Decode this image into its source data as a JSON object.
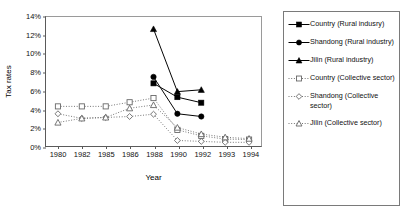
{
  "chart_data": {
    "type": "line",
    "title": "",
    "xlabel": "Year",
    "ylabel": "Tax rates",
    "categories": [
      "1980",
      "1982",
      "1985",
      "1986",
      "1988",
      "1990",
      "1992",
      "1993",
      "1994"
    ],
    "ylim": [
      0,
      14
    ],
    "ytick_values": [
      0,
      2,
      4,
      6,
      8,
      10,
      12,
      14
    ],
    "ytick_labels": [
      "0%",
      "2%",
      "4%",
      "6%",
      "8%",
      "10%",
      "12%",
      "14%"
    ],
    "grid": false,
    "legend_position": "right-outside",
    "series": [
      {
        "name": "Country (Rural indusry)",
        "marker": "filled-square",
        "line": "solid",
        "color": "#000000",
        "x": [
          "1988",
          "1990",
          "1992"
        ],
        "values": [
          6.8,
          5.3,
          4.7
        ]
      },
      {
        "name": "Shandong (Rural industry)",
        "marker": "filled-circle",
        "line": "solid",
        "color": "#000000",
        "x": [
          "1988",
          "1990",
          "1992"
        ],
        "values": [
          7.5,
          3.5,
          3.2
        ]
      },
      {
        "name": "Jilin (Rural industry)",
        "marker": "filled-triangle",
        "line": "solid",
        "color": "#000000",
        "x": [
          "1988",
          "1990",
          "1992"
        ],
        "values": [
          12.7,
          5.9,
          6.1
        ]
      },
      {
        "name": "Country (Collective sector)",
        "marker": "open-square",
        "line": "dotted",
        "color": "#666666",
        "x": [
          "1980",
          "1982",
          "1985",
          "1986",
          "1988",
          "1990",
          "1992",
          "1993",
          "1994"
        ],
        "values": [
          4.3,
          4.3,
          4.3,
          4.75,
          5.2,
          1.75,
          1.1,
          0.75,
          0.7
        ]
      },
      {
        "name": "Shandong (Collective sector)",
        "marker": "open-diamond",
        "line": "dotted",
        "color": "#666666",
        "x": [
          "1980",
          "1982",
          "1985",
          "1986",
          "1988",
          "1990",
          "1992",
          "1993",
          "1994"
        ],
        "values": [
          3.5,
          3.0,
          3.1,
          3.2,
          3.45,
          0.6,
          0.5,
          0.4,
          0.4
        ]
      },
      {
        "name": "Jilin (Collective sector)",
        "marker": "open-triangle",
        "line": "dotted",
        "color": "#666666",
        "x": [
          "1980",
          "1982",
          "1985",
          "1986",
          "1988",
          "1990",
          "1992",
          "1993",
          "1994"
        ],
        "values": [
          2.55,
          3.0,
          3.1,
          4.1,
          4.45,
          2.0,
          1.3,
          0.95,
          0.8
        ]
      }
    ]
  },
  "legend": {
    "items": [
      {
        "label": "Country (Rural indusry)",
        "marker": "filled-square",
        "line": "solid"
      },
      {
        "label": "Shandong (Rural industry)",
        "marker": "filled-circle",
        "line": "solid"
      },
      {
        "label": "Jilin (Rural industry)",
        "marker": "filled-triangle",
        "line": "solid"
      },
      {
        "label": "Country (Collective sector)",
        "marker": "open-square",
        "line": "dotted"
      },
      {
        "label": "Shandong (Collective sector)",
        "marker": "open-diamond",
        "line": "dotted"
      },
      {
        "label": "Jilin (Collective sector)",
        "marker": "open-triangle",
        "line": "dotted"
      }
    ]
  }
}
